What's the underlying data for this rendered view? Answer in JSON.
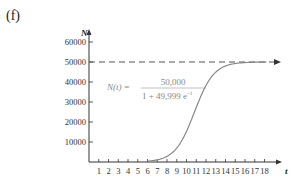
{
  "panel_label": "(f)",
  "chart_data": {
    "type": "line",
    "title": "",
    "xlabel": "t",
    "ylabel": "N",
    "xlim": [
      0,
      18
    ],
    "ylim": [
      0,
      60000
    ],
    "x_ticks": [
      1,
      2,
      3,
      4,
      5,
      6,
      7,
      8,
      9,
      10,
      11,
      12,
      13,
      14,
      15,
      16,
      17,
      18
    ],
    "y_ticks": [
      10000,
      20000,
      30000,
      40000,
      50000,
      60000
    ],
    "y_tick_labels": [
      "10000",
      "20000",
      "30000",
      "40000",
      "50000",
      "60000"
    ],
    "grid": false,
    "legend": null,
    "annotation": {
      "lhs": "N(t) =",
      "numerator": "50,000",
      "denominator": "1 + 49,999 e",
      "exponent": "−t"
    },
    "asymptote": {
      "y": 50000,
      "style": "dashed",
      "arrow": true
    },
    "series": [
      {
        "name": "N(t) = 50000 / (1 + 49999 e^(-t))",
        "formula": {
          "K": 50000,
          "A": 49999,
          "r": 1
        },
        "x": [
          6,
          7,
          8,
          9,
          10,
          11,
          12,
          13,
          14,
          15,
          16,
          17,
          18
        ],
        "values": [
          3740,
          9010,
          21150,
          35200,
          45800,
          48870,
          49600,
          49850,
          49950,
          49980,
          49990,
          49997,
          49999
        ]
      }
    ],
    "colors": {
      "curve": "#888888",
      "axis": "#333333",
      "asymptote": "#555555"
    }
  }
}
